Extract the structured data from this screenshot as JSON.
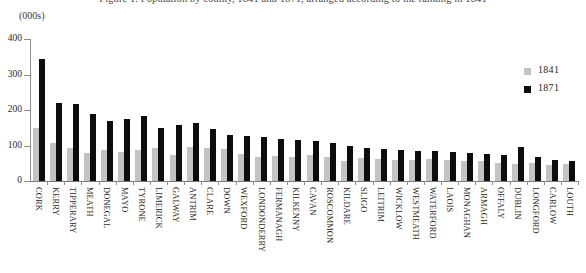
{
  "chart_title": "Figure 1. Population by county, 1841 and 1871, arranged according to the ranking in 1841",
  "units_label": "(000s)",
  "legend": {
    "position": "top-right",
    "entries": [
      {
        "label": "1841",
        "color": "#c3c3c3"
      },
      {
        "label": "1871",
        "color": "#0d0d0d"
      }
    ]
  },
  "y_axis": {
    "ticks": [
      "0",
      "100",
      "200",
      "300",
      "400"
    ],
    "min": 0,
    "max": 400
  },
  "chart_data": {
    "type": "bar",
    "title": "Figure 1. Population by county, 1841 and 1871, arranged according to the ranking in 1841",
    "xlabel": "",
    "ylabel": "(000s)",
    "ylim": [
      0,
      400
    ],
    "grid": false,
    "legend_position": "top-right",
    "categories": [
      "CORK",
      "KERRY",
      "TIPPERARY",
      "MEATH",
      "DONEGAL",
      "MAYO",
      "TYRONE",
      "LIMERICK",
      "GALWAY",
      "ANTRIM",
      "CLARE",
      "DOWN",
      "WEXFORD",
      "LONDONDERRY",
      "FERMANAGH",
      "KILKENNY",
      "CAVAN",
      "ROSCOMMON",
      "KILDARE",
      "SLIGO",
      "LEITRIM",
      "WICKLOW",
      "WESTMEATH",
      "WATERFORD",
      "LAOIS",
      "MONAGHAN",
      "ARMAGH",
      "OFFALY",
      "DUBLIN",
      "LONGFORD",
      "CARLOW",
      "LOUTH"
    ],
    "series": [
      {
        "name": "1841",
        "color": "#c3c3c3",
        "values": [
          150,
          106,
          92,
          80,
          88,
          82,
          86,
          92,
          72,
          97,
          92,
          91,
          75,
          69,
          70,
          67,
          73,
          68,
          56,
          66,
          63,
          58,
          59,
          61,
          59,
          55,
          57,
          52,
          49,
          50,
          45,
          48
        ]
      },
      {
        "name": "1871",
        "color": "#0d0d0d",
        "values": [
          345,
          220,
          216,
          188,
          168,
          176,
          182,
          150,
          158,
          163,
          147,
          130,
          126,
          124,
          118,
          116,
          112,
          108,
          100,
          93,
          90,
          88,
          85,
          84,
          82,
          79,
          76,
          72,
          95,
          68,
          60,
          55
        ]
      }
    ]
  }
}
